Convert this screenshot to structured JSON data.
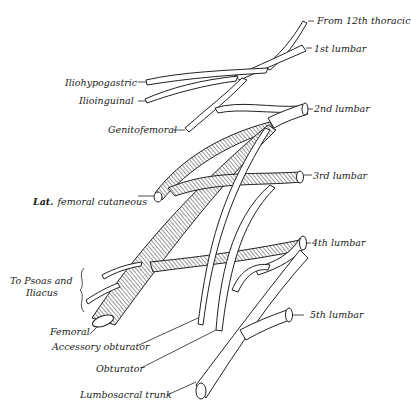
{
  "diagram": {
    "labels": {
      "from_12th_thoracic": "From 12th thoracic",
      "lumbar_1": "1st lumbar",
      "lumbar_2": "2nd lumbar",
      "lumbar_3": "3rd lumbar",
      "lumbar_4": "4th lumbar",
      "lumbar_5": "5th lumbar",
      "iliohypogastric": "Iliohypogastric",
      "ilioinguinal": "Ilioinguinal",
      "genitofemoral": "Genitofemoral",
      "lat_femoral_cutaneous_a": "Lat.",
      "lat_femoral_cutaneous_b": "femoral cutaneous",
      "to_psoas_line1": "To Psoas and",
      "to_psoas_line2": "Iliacus",
      "femoral": "Femoral",
      "accessory_obturator": "Accessory obturator",
      "obturator": "Obturator",
      "lumbosacral_trunk": "Lumbosacral trunk"
    },
    "colors": {
      "ink": "#222222",
      "background": "#ffffff"
    }
  }
}
